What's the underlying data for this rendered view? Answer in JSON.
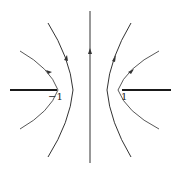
{
  "diagram": {
    "colors": {
      "stroke": "#333333",
      "slit": "#1a1a1a",
      "background": "#ffffff"
    },
    "labels": {
      "left_point": "−1",
      "right_point": "1"
    },
    "slits": [
      {
        "name": "left-slit",
        "from": "-inf",
        "to": -1
      },
      {
        "name": "right-slit",
        "from": 1,
        "to": "inf"
      }
    ],
    "curves": [
      {
        "name": "outer-left-hyperbola",
        "direction": "up"
      },
      {
        "name": "inner-left-hyperbola",
        "direction": "up"
      },
      {
        "name": "center-axis-line",
        "direction": "up"
      },
      {
        "name": "inner-right-hyperbola",
        "direction": "up"
      },
      {
        "name": "outer-right-hyperbola",
        "direction": "up"
      }
    ]
  }
}
